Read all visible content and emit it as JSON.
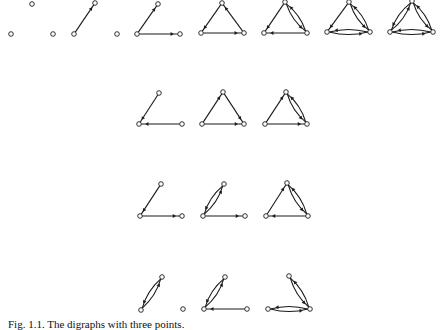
{
  "figure": {
    "caption": "Fig. 1.1. The digraphs with three points.",
    "colors": {
      "stroke": "#1a1a1a",
      "node_fill": "#ffffff",
      "background": "#ffffff"
    },
    "node_radius": 2.3,
    "digraphs": [
      {
        "id": "r1g1",
        "row": 1,
        "nodes": [
          [
            11,
            34
          ],
          [
            32,
            4
          ],
          [
            53,
            34
          ]
        ],
        "arcs": []
      },
      {
        "id": "r1g2",
        "row": 1,
        "nodes": [
          [
            74,
            34
          ],
          [
            95,
            3
          ],
          [
            117,
            34
          ]
        ],
        "arcs": [
          [
            0,
            1
          ]
        ]
      },
      {
        "id": "r1g3",
        "row": 1,
        "nodes": [
          [
            137,
            34
          ],
          [
            158,
            4
          ],
          [
            180,
            34
          ]
        ],
        "arcs": [
          [
            0,
            1
          ],
          [
            0,
            2
          ]
        ]
      },
      {
        "id": "r1g4",
        "row": 1,
        "nodes": [
          [
            201,
            33
          ],
          [
            222,
            3
          ],
          [
            244,
            33
          ]
        ],
        "arcs": [
          [
            1,
            0
          ],
          [
            0,
            2
          ],
          [
            2,
            1
          ]
        ]
      },
      {
        "id": "r1g5",
        "row": 1,
        "nodes": [
          [
            264,
            33
          ],
          [
            285,
            2
          ],
          [
            307,
            33
          ]
        ],
        "arcs": [
          [
            1,
            0
          ],
          [
            2,
            0
          ],
          [
            1,
            2
          ],
          [
            2,
            1
          ]
        ]
      },
      {
        "id": "r1g6",
        "row": 1,
        "nodes": [
          [
            327,
            32
          ],
          [
            349,
            2
          ],
          [
            370,
            32
          ]
        ],
        "arcs": [
          [
            1,
            0
          ],
          [
            1,
            2
          ],
          [
            2,
            1
          ],
          [
            0,
            2
          ],
          [
            2,
            0
          ]
        ]
      },
      {
        "id": "r1g7",
        "row": 1,
        "nodes": [
          [
            390,
            32
          ],
          [
            412,
            1
          ],
          [
            433,
            32
          ]
        ],
        "arcs": [
          [
            0,
            1
          ],
          [
            1,
            0
          ],
          [
            1,
            2
          ],
          [
            2,
            1
          ],
          [
            0,
            2
          ],
          [
            2,
            0
          ]
        ]
      },
      {
        "id": "r2g1",
        "row": 2,
        "nodes": [
          [
            139,
            124
          ],
          [
            159,
            93
          ],
          [
            182,
            124
          ]
        ],
        "arcs": [
          [
            1,
            0
          ],
          [
            2,
            0
          ]
        ]
      },
      {
        "id": "r2g2",
        "row": 2,
        "nodes": [
          [
            202,
            124
          ],
          [
            223,
            92
          ],
          [
            244,
            124
          ]
        ],
        "arcs": [
          [
            0,
            1
          ],
          [
            1,
            2
          ],
          [
            0,
            2
          ]
        ]
      },
      {
        "id": "r2g3",
        "row": 2,
        "nodes": [
          [
            265,
            124
          ],
          [
            286,
            92
          ],
          [
            307,
            124
          ]
        ],
        "arcs": [
          [
            0,
            1
          ],
          [
            1,
            2
          ],
          [
            2,
            1
          ],
          [
            0,
            2
          ]
        ]
      },
      {
        "id": "r3g1",
        "row": 3,
        "nodes": [
          [
            140,
            216
          ],
          [
            161,
            184
          ],
          [
            182,
            216
          ]
        ],
        "arcs": [
          [
            1,
            0
          ],
          [
            0,
            2
          ]
        ]
      },
      {
        "id": "r3g2",
        "row": 3,
        "nodes": [
          [
            203,
            216
          ],
          [
            224,
            184
          ],
          [
            245,
            216
          ]
        ],
        "arcs": [
          [
            0,
            1
          ],
          [
            1,
            0
          ],
          [
            0,
            2
          ]
        ]
      },
      {
        "id": "r3g3",
        "row": 3,
        "nodes": [
          [
            266,
            216
          ],
          [
            287,
            183
          ],
          [
            308,
            216
          ]
        ],
        "arcs": [
          [
            0,
            1
          ],
          [
            1,
            2
          ],
          [
            2,
            1
          ],
          [
            2,
            0
          ]
        ]
      },
      {
        "id": "r4g1",
        "row": 4,
        "nodes": [
          [
            141,
            310
          ],
          [
            162,
            277
          ],
          [
            183,
            309
          ]
        ],
        "arcs": [
          [
            0,
            1
          ],
          [
            1,
            0
          ]
        ]
      },
      {
        "id": "r4g2",
        "row": 4,
        "nodes": [
          [
            204,
            309
          ],
          [
            225,
            277
          ],
          [
            247,
            309
          ]
        ],
        "arcs": [
          [
            0,
            1
          ],
          [
            1,
            0
          ],
          [
            2,
            0
          ]
        ]
      },
      {
        "id": "r4g3",
        "row": 4,
        "nodes": [
          [
            268,
            309
          ],
          [
            289,
            276
          ],
          [
            310,
            309
          ]
        ],
        "arcs": [
          [
            1,
            2
          ],
          [
            2,
            1
          ],
          [
            0,
            2
          ],
          [
            2,
            0
          ]
        ]
      }
    ]
  }
}
